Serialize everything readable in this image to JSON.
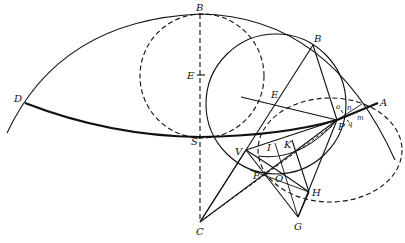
{
  "figure": {
    "labels": {
      "B_top": "B",
      "E_center": "E",
      "D": "D",
      "S": "S",
      "C": "C",
      "B_right": "B",
      "E_left": "E",
      "A": "A",
      "o": "o",
      "n": "n",
      "m": "m",
      "q": "q",
      "P": "P",
      "V": "V",
      "I": "I",
      "K": "K",
      "F": "F",
      "O": "O",
      "H": "H",
      "G": "G"
    },
    "points": {
      "B_top": [
        200,
        14
      ],
      "E_center": [
        202,
        75
      ],
      "D": [
        25,
        103
      ],
      "S": [
        200,
        137
      ],
      "C": [
        200,
        222
      ],
      "B_right": [
        313,
        45
      ],
      "E_left": [
        284,
        97
      ],
      "A": [
        378,
        103
      ],
      "P": [
        337,
        120
      ],
      "V": [
        246,
        150
      ],
      "I": [
        270,
        149
      ],
      "K": [
        292,
        146
      ],
      "F": [
        259,
        175
      ],
      "O": [
        278,
        180
      ],
      "H": [
        309,
        192
      ],
      "G": [
        298,
        217
      ]
    },
    "colors": {
      "ink": "#111111",
      "background": "#ffffff"
    }
  }
}
